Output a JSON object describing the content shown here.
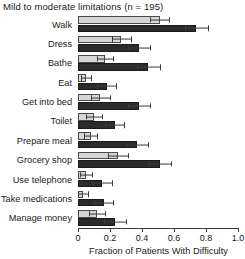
{
  "chart_data": {
    "type": "bar",
    "orientation": "horizontal",
    "title": "Mild to moderate limitations (n = 195)",
    "xlabel": "Fraction of Patients With Difficulty",
    "ylabel": "",
    "xlim": [
      0,
      1.0
    ],
    "xticks": [
      0,
      0.2,
      0.4,
      0.6,
      0.8,
      1.0
    ],
    "xticklabels": [
      "0",
      "0.2",
      "0.4",
      "0.6",
      "0.8",
      "1.0"
    ],
    "grid": false,
    "legend": "none",
    "categories": [
      "Walk",
      "Dress",
      "Bathe",
      "Eat",
      "Get into bed",
      "Toilet",
      "Prepare meal",
      "Grocery shop",
      "Use telephone",
      "Take medications",
      "Manage money"
    ],
    "series": [
      {
        "name": "light",
        "color": "#d6d6d6",
        "values": [
          0.51,
          0.27,
          0.17,
          0.05,
          0.14,
          0.1,
          0.08,
          0.25,
          0.05,
          0.03,
          0.12
        ],
        "errors_high": [
          0.57,
          0.33,
          0.22,
          0.08,
          0.2,
          0.15,
          0.12,
          0.31,
          0.09,
          0.06,
          0.17
        ],
        "errors_low": [
          0.45,
          0.21,
          0.12,
          0.02,
          0.08,
          0.05,
          0.04,
          0.19,
          0.01,
          0.0,
          0.07
        ]
      },
      {
        "name": "dark",
        "color": "#2b2b2b",
        "values": [
          0.74,
          0.38,
          0.44,
          0.18,
          0.38,
          0.23,
          0.37,
          0.51,
          0.15,
          0.16,
          0.23
        ],
        "errors_high": [
          0.81,
          0.45,
          0.51,
          0.24,
          0.45,
          0.29,
          0.44,
          0.58,
          0.21,
          0.22,
          0.3
        ],
        "errors_low": [
          0.67,
          0.31,
          0.37,
          0.12,
          0.31,
          0.17,
          0.3,
          0.44,
          0.09,
          0.1,
          0.16
        ]
      }
    ]
  }
}
